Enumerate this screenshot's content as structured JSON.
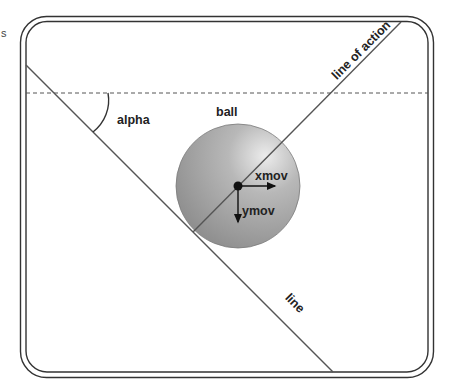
{
  "stray_text": "s",
  "labels": {
    "alpha": "alpha",
    "ball": "ball",
    "xmov": "xmov",
    "ymov": "ymov",
    "line": "line",
    "line_of_action": "line of action"
  },
  "colors": {
    "frame": "#333333",
    "line": "#555555",
    "dashed": "#555555",
    "ball_highlight": "#e6e6e6",
    "ball_mid": "#aaaaaa",
    "ball_edge": "#8a8a8a",
    "vector": "#111111"
  },
  "angles": {
    "line_deg": 45,
    "line_of_action_deg": -45
  }
}
